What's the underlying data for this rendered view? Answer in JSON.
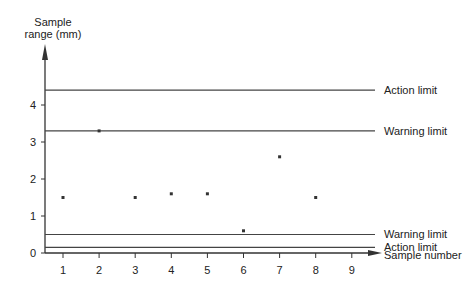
{
  "chart_data": {
    "type": "scatter",
    "title": "",
    "xlabel": "Sample number",
    "ylabel": "Sample range (mm)",
    "ylabel_lines": [
      "Sample",
      "range (mm)"
    ],
    "x_ticks": [
      1,
      2,
      3,
      4,
      5,
      6,
      7,
      8,
      9
    ],
    "y_ticks": [
      0,
      1,
      2,
      3,
      4
    ],
    "xlim": [
      0,
      9.5
    ],
    "ylim": [
      0,
      5
    ],
    "grid": false,
    "series": [
      {
        "name": "Sample range",
        "marker": "x",
        "x": [
          1,
          2,
          3,
          4,
          5,
          6,
          7,
          8
        ],
        "values": [
          1.5,
          3.3,
          1.5,
          1.6,
          1.6,
          0.6,
          2.6,
          1.5
        ]
      }
    ],
    "reference_lines": [
      {
        "label": "Action limit",
        "y": 4.4
      },
      {
        "label": "Warning limit",
        "y": 3.3
      },
      {
        "label": "Warning limit",
        "y": 0.5
      },
      {
        "label": "Action limit",
        "y": 0.15
      }
    ]
  }
}
